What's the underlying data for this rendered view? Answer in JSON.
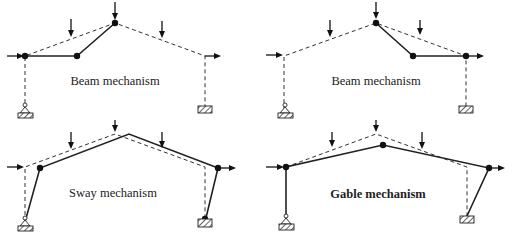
{
  "figure": {
    "panels": [
      {
        "id": "top-left",
        "label": "Beam mechanism",
        "bold": false,
        "hinges": [
          [
            25,
            56
          ],
          [
            77,
            56
          ],
          [
            115,
            23
          ]
        ],
        "original_frame": [
          [
            25,
            113
          ],
          [
            25,
            56
          ],
          [
            115,
            23
          ],
          [
            205,
            56
          ],
          [
            205,
            113
          ]
        ],
        "deformed_members": [
          [
            [
              25,
              56
            ],
            [
              77,
              56
            ],
            [
              115,
              23
            ]
          ]
        ],
        "vertical_loads_x": [
          71,
          115,
          162
        ],
        "horizontal_loads": [
          {
            "from": [
              7,
              56
            ],
            "to": [
              25,
              56
            ]
          },
          {
            "from": [
              205,
              56
            ],
            "to": [
              223,
              56
            ]
          }
        ],
        "supports": [
          {
            "type": "pinned",
            "x": 25,
            "y": 113
          },
          {
            "type": "fixed",
            "x": 205,
            "y": 111
          }
        ]
      },
      {
        "id": "top-right",
        "label": "Beam mechanism",
        "bold": false,
        "hinges": [
          [
            376,
            23
          ],
          [
            413,
            56
          ],
          [
            466,
            56
          ]
        ],
        "original_frame": [
          [
            284,
            113
          ],
          [
            284,
            56
          ],
          [
            376,
            23
          ],
          [
            466,
            56
          ],
          [
            466,
            111
          ]
        ],
        "deformed_members": [
          [
            [
              376,
              23
            ],
            [
              413,
              56
            ],
            [
              466,
              56
            ]
          ]
        ],
        "vertical_loads_x": [
          330,
          376,
          420
        ],
        "horizontal_loads": [
          {
            "from": [
              266,
              56
            ],
            "to": [
              284,
              56
            ]
          },
          {
            "from": [
              466,
              56
            ],
            "to": [
              485,
              56
            ]
          }
        ],
        "supports": [
          {
            "type": "pinned",
            "x": 285,
            "y": 113
          },
          {
            "type": "fixed",
            "x": 466,
            "y": 110
          }
        ]
      },
      {
        "id": "bottom-left",
        "label": "Sway mechanism",
        "bold": false,
        "hinges": [
          [
            40,
            168
          ],
          [
            218,
            168
          ]
        ],
        "original_frame": [
          [
            25,
            227
          ],
          [
            25,
            167
          ],
          [
            115,
            134
          ],
          [
            205,
            167
          ],
          [
            205,
            223
          ]
        ],
        "deformed_members": [
          [
            [
              25,
              227
            ],
            [
              40,
              168
            ],
            [
              129,
              134
            ],
            [
              218,
              168
            ],
            [
              205,
              223
            ]
          ]
        ],
        "vertical_loads_x": [
          71,
          115,
          162
        ],
        "horizontal_loads": [
          {
            "from": [
              7,
              167
            ],
            "to": [
              25,
              167
            ]
          },
          {
            "from": [
              218,
              168
            ],
            "to": [
              237,
              168
            ]
          }
        ],
        "supports": [
          {
            "type": "pinned",
            "x": 25,
            "y": 228
          },
          {
            "type": "fixed-with-hinge",
            "x": 205,
            "y": 224
          }
        ]
      },
      {
        "id": "bottom-right",
        "label": "Gable mechanism",
        "bold": true,
        "hinges": [
          [
            286,
            167
          ],
          [
            383,
            145
          ],
          [
            489,
            168
          ]
        ],
        "original_frame": [
          [
            286,
            167
          ],
          [
            376,
            134
          ],
          [
            467,
            167
          ],
          [
            467,
            218
          ]
        ],
        "deformed_members": [
          [
            [
              286,
              220
            ],
            [
              286,
              167
            ],
            [
              383,
              145
            ],
            [
              489,
              168
            ],
            [
              467,
              218
            ]
          ]
        ],
        "vertical_loads_x": [
          332,
          376,
          422
        ],
        "horizontal_loads": [
          {
            "from": [
              266,
              167
            ],
            "to": [
              286,
              167
            ]
          },
          {
            "from": [
              489,
              168
            ],
            "to": [
              507,
              168
            ]
          }
        ],
        "supports": [
          {
            "type": "pinned",
            "x": 286,
            "y": 221
          },
          {
            "type": "fixed",
            "x": 467,
            "y": 220
          }
        ]
      }
    ],
    "label_positions": [
      {
        "x": 115,
        "y": 85
      },
      {
        "x": 376,
        "y": 85
      },
      {
        "x": 115,
        "y": 197
      },
      {
        "x": 376,
        "y": 198
      }
    ]
  }
}
